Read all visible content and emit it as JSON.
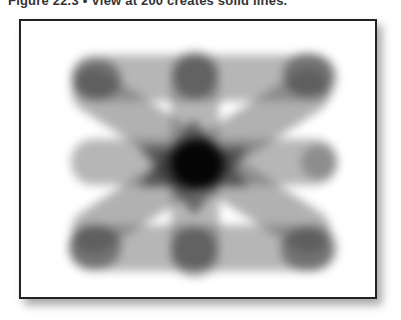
{
  "caption": {
    "text": "Figure 22.3 • View at 200 creates solid lines."
  },
  "figure": {
    "strokes": [
      {
        "name": "horizontal-top",
        "x": 55,
        "y": 43,
        "w": 250,
        "h": 44,
        "angle": 0
      },
      {
        "name": "horizontal-middle",
        "x": 55,
        "y": 118,
        "w": 250,
        "h": 44,
        "angle": 0
      },
      {
        "name": "horizontal-bottom",
        "x": 55,
        "y": 194,
        "w": 250,
        "h": 44,
        "angle": 0
      },
      {
        "name": "vertical-center",
        "x": 157,
        "y": 30,
        "w": 44,
        "h": 230,
        "angle": 0
      },
      {
        "name": "diagonal-down",
        "x": 30,
        "y": 118,
        "w": 300,
        "h": 44,
        "angle": 34
      },
      {
        "name": "diagonal-up",
        "x": 30,
        "y": 118,
        "w": 300,
        "h": 44,
        "angle": -34
      }
    ],
    "colors": {
      "frame_border": "#222222",
      "stroke": "#5a5a5a",
      "core": "#000000"
    }
  }
}
